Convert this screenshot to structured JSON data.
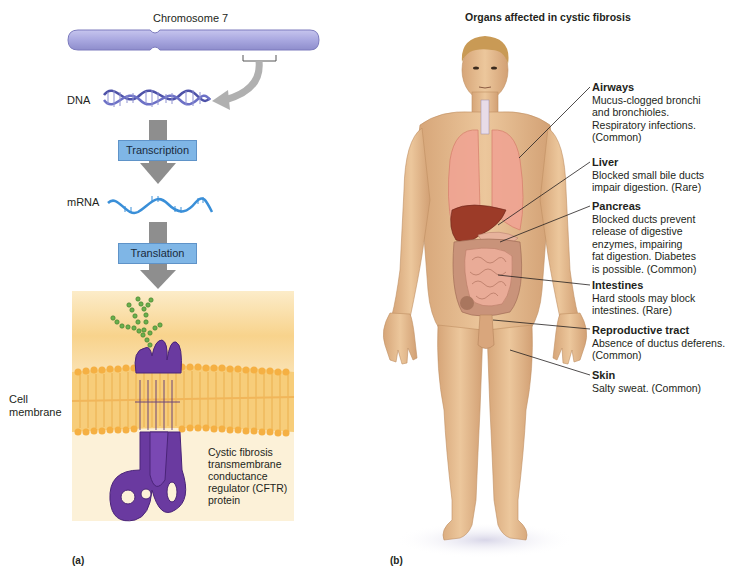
{
  "panel_a": {
    "letter": "(a)",
    "chromosome_label": "Chromosome 7",
    "dna_label": "DNA",
    "step1_label": "Transcription",
    "mrna_label": "mRNA",
    "step2_label": "Translation",
    "membrane_label_line1": "Cell",
    "membrane_label_line2": "membrane",
    "protein_label": [
      "Cystic fibrosis",
      "transmembrane",
      "conductance",
      "regulator (CFTR)",
      "protein"
    ],
    "colors": {
      "chromosome": "#a7a6dc",
      "dna": "#5b5fb5",
      "mrna": "#3a8fd8",
      "arrow": "#8e8e8e",
      "step_box": "#7fb6e6",
      "membrane_bg": "#fbe7bf",
      "lipid": "#f5b043",
      "protein": "#6a3aa0",
      "carbohydrate": "#6ab04c"
    }
  },
  "panel_b": {
    "letter": "(b)",
    "title": "Organs affected in cystic fibrosis",
    "callouts": [
      {
        "title": "Airways",
        "lines": [
          "Mucus-clogged bronchi",
          "and bronchioles.",
          "Respiratory infections.",
          "(Common)"
        ]
      },
      {
        "title": "Liver",
        "lines": [
          "Blocked small bile ducts",
          "impair digestion. (Rare)"
        ]
      },
      {
        "title": "Pancreas",
        "lines": [
          "Blocked ducts prevent",
          "release of digestive",
          "enzymes, impairing",
          "fat digestion. Diabetes",
          "is possible. (Common)"
        ]
      },
      {
        "title": "Intestines",
        "lines": [
          "Hard stools may block",
          "intestines. (Rare)"
        ]
      },
      {
        "title": "Reproductive tract",
        "lines": [
          "Absence of ductus deferens.",
          "(Common)"
        ]
      },
      {
        "title": "Skin",
        "lines": [
          "Salty sweat. (Common)"
        ]
      }
    ],
    "colors": {
      "skin": "#e3b98c",
      "lungs": "#f0a493",
      "liver": "#9c3b28",
      "intestine": "#e2a38f",
      "hair": "#c99a55"
    }
  }
}
